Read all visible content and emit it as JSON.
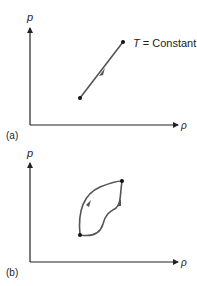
{
  "panels": [
    {
      "id": "a",
      "label": "(a)",
      "y_axis_label": "p",
      "x_axis_label": "ρ",
      "annotation_var": "T",
      "annotation_rest": " = Constant",
      "path_type": "straight line process (isothermal)",
      "start_point": {
        "x": 80,
        "y": 98
      },
      "end_point": {
        "x": 123,
        "y": 42
      }
    },
    {
      "id": "b",
      "label": "(b)",
      "y_axis_label": "p",
      "x_axis_label": "ρ",
      "path_type": "two different curved paths between same endpoints",
      "start_point": {
        "x": 80,
        "y": 235
      },
      "end_point": {
        "x": 122,
        "y": 181
      }
    }
  ],
  "colors": {
    "axis": "#222222",
    "curve": "#555555",
    "background": "#ffffff"
  }
}
